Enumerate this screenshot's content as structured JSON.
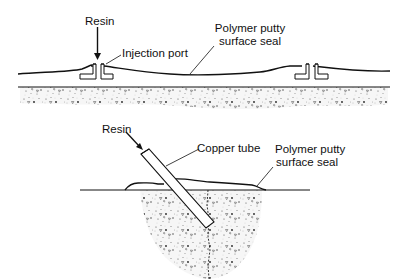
{
  "figure": {
    "clipped_title": "",
    "top_diagram": {
      "labels": {
        "resin": "Resin",
        "injection_port": "Injection port",
        "seal_line1": "Polymer putty",
        "seal_line2": "surface seal"
      }
    },
    "bottom_diagram": {
      "labels": {
        "resin": "Resin",
        "copper_tube": "Copper tube",
        "seal_line1": "Polymer putty",
        "seal_line2": "surface seal"
      }
    },
    "colors": {
      "ink": "#111111",
      "concrete_fill": "#f4f4f4",
      "background": "#ffffff"
    }
  }
}
